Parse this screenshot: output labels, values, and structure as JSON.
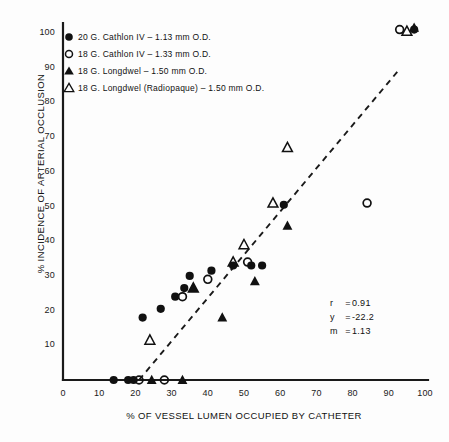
{
  "chart_data": {
    "type": "scatter",
    "title": "",
    "xlabel": "% OF VESSEL LUMEN OCCUPIED BY CATHETER",
    "ylabel": "% INCIDENCE OF ARTERIAL OCCLUSION",
    "xlim": [
      0,
      100
    ],
    "ylim": [
      0,
      100
    ],
    "xticks": [
      0,
      10,
      20,
      30,
      40,
      50,
      60,
      70,
      80,
      90,
      100
    ],
    "yticks": [
      10,
      20,
      30,
      40,
      50,
      60,
      70,
      80,
      90,
      100
    ],
    "grid": false,
    "legend_position": "top-left",
    "marker_color": "#111111",
    "series": [
      {
        "name": "20 G. Cathlon IV - 1.13 mm O.D.",
        "marker": "filled-circle",
        "points": [
          [
            14,
            0
          ],
          [
            18,
            0
          ],
          [
            19.5,
            0
          ],
          [
            22,
            18
          ],
          [
            27,
            20.5
          ],
          [
            31,
            24
          ],
          [
            33.5,
            26.5
          ],
          [
            35,
            30
          ],
          [
            41,
            31.5
          ],
          [
            47,
            33
          ],
          [
            52,
            33
          ],
          [
            55,
            33
          ],
          [
            61,
            50.5
          ],
          [
            97,
            101
          ]
        ]
      },
      {
        "name": "18 G. Cathlon IV - 1.33 mm O.D.",
        "marker": "open-circle",
        "points": [
          [
            21,
            0
          ],
          [
            28,
            0
          ],
          [
            33,
            24
          ],
          [
            40,
            29
          ],
          [
            51,
            34
          ],
          [
            84,
            51
          ],
          [
            93,
            101
          ]
        ]
      },
      {
        "name": "18 G. Longdwel - 1.50 mm O.D.",
        "marker": "filled-triangle",
        "points": [
          [
            24.5,
            0
          ],
          [
            33,
            0
          ],
          [
            36,
            26.5
          ],
          [
            44,
            18
          ],
          [
            53,
            28.5
          ],
          [
            62,
            44.5
          ],
          [
            97,
            101.5
          ]
        ]
      },
      {
        "name": "18 G. Longdwel (Radiopaque) - 1.50 mm O.D.",
        "marker": "open-triangle",
        "points": [
          [
            24,
            11.5
          ],
          [
            36,
            26.5
          ],
          [
            47,
            34
          ],
          [
            50,
            39
          ],
          [
            62,
            67
          ],
          [
            58,
            51
          ],
          [
            95,
            100.5
          ]
        ]
      }
    ],
    "trendline": {
      "style": "dashed",
      "x_start": 21,
      "y_start": 0,
      "x_end": 92.5,
      "y_end": 89,
      "slope": 1.13,
      "intercept": -22.2
    },
    "annotations": {
      "r_label": "r",
      "r_value": "0.91",
      "y_label": "y",
      "y_value": "-22.2",
      "m_label": "m",
      "m_value": "1.13",
      "equals": "="
    }
  },
  "legend": {
    "items": [
      {
        "marker": "filled-circle",
        "label": "20 G. Cathlon IV – 1.13 mm O.D."
      },
      {
        "marker": "open-circle",
        "label": "18 G. Cathlon IV – 1.33 mm O.D."
      },
      {
        "marker": "filled-triangle",
        "label": "18 G. Longdwel  – 1.50 mm O.D."
      },
      {
        "marker": "open-triangle",
        "label": "18 G. Longdwel (Radiopaque)  – 1.50 mm O.D."
      }
    ]
  }
}
